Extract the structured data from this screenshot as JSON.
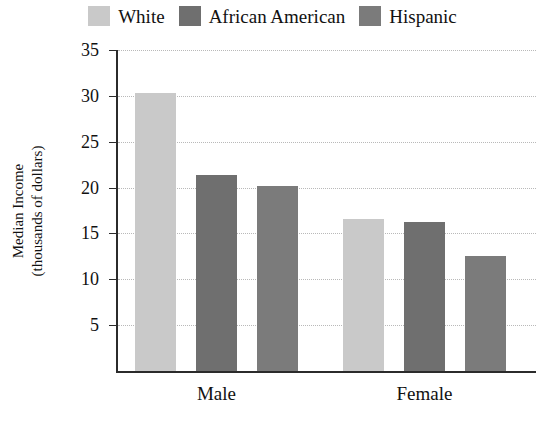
{
  "chart_data": {
    "type": "bar",
    "title": "",
    "xlabel": "",
    "ylabel": "Median Income (thousands of dollars)",
    "ylabel_line1": "Median Income",
    "ylabel_line2": "(thousands of dollars)",
    "categories": [
      "Male",
      "Female"
    ],
    "series": [
      {
        "name": "White",
        "color": "#c9c9c9",
        "values": [
          30.3,
          16.6
        ]
      },
      {
        "name": "African American",
        "color": "#6f6f6f",
        "values": [
          21.4,
          16.2
        ]
      },
      {
        "name": "Hispanic",
        "color": "#7b7b7b",
        "values": [
          20.2,
          12.5
        ]
      }
    ],
    "ylim": [
      0,
      35
    ],
    "yticks": [
      5,
      10,
      15,
      20,
      25,
      30,
      35
    ],
    "ytick_labels": [
      "5",
      "10",
      "15",
      "20",
      "25",
      "30",
      "35"
    ],
    "grid": true,
    "grid_style": "dotted",
    "legend_position": "top-center",
    "axis_color": "#2b2b2b",
    "grid_color": "#b9b9b9",
    "background": "#ffffff"
  }
}
